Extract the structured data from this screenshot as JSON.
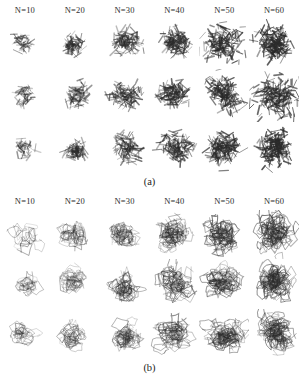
{
  "figure": {
    "ink_color": "#2b2b2b",
    "background": "#ffffff",
    "panels": [
      {
        "id": "a",
        "caption": "(a)",
        "style": "stick-aggregate",
        "rows": 3,
        "columns": [
          {
            "label": "N=10",
            "n": 10
          },
          {
            "label": "N=20",
            "n": 20
          },
          {
            "label": "N=30",
            "n": 30
          },
          {
            "label": "N=40",
            "n": 40
          },
          {
            "label": "N=50",
            "n": 50
          },
          {
            "label": "N=60",
            "n": 60
          }
        ]
      },
      {
        "id": "b",
        "caption": "(b)",
        "style": "loop-scribble",
        "rows": 3,
        "columns": [
          {
            "label": "N=10",
            "n": 10
          },
          {
            "label": "N=20",
            "n": 20
          },
          {
            "label": "N=30",
            "n": 30
          },
          {
            "label": "N=40",
            "n": 40
          },
          {
            "label": "N=50",
            "n": 50
          },
          {
            "label": "N=60",
            "n": 60
          }
        ]
      }
    ]
  }
}
